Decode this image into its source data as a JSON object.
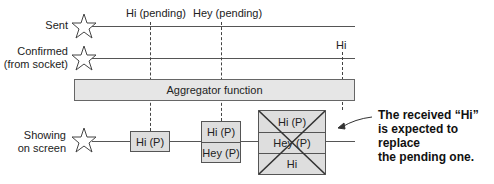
{
  "rows": [
    {
      "id": "sent",
      "label_lines": [
        "Sent"
      ]
    },
    {
      "id": "confirmed",
      "label_lines": [
        "Confirmed",
        "(from socket)"
      ]
    },
    {
      "id": "showing",
      "label_lines": [
        "Showing",
        "on screen"
      ]
    }
  ],
  "events": {
    "hi_pending": "Hi (pending)",
    "hey_pending": "Hey (pending)",
    "hi_confirmed": "Hi"
  },
  "aggregator": {
    "label": "Aggregator function"
  },
  "screen_states": [
    {
      "cells": [
        "Hi (P)"
      ]
    },
    {
      "cells": [
        "Hi (P)",
        "Hey (P)"
      ]
    },
    {
      "cells": [
        "Hi (P)",
        "Hey (P)",
        "Hi"
      ],
      "crossed_out": true
    }
  ],
  "annotation": {
    "lines": [
      "The received “Hi”",
      "is expected to replace",
      "the pending one."
    ]
  },
  "icons": {
    "row_marker": "star-outline-icon",
    "annotation_pointer": "arrow-left-icon"
  },
  "colors": {
    "line": "#555555",
    "box_fill": "#dedede",
    "aggregator_fill": "#e6e6e6",
    "text": "#222222"
  }
}
